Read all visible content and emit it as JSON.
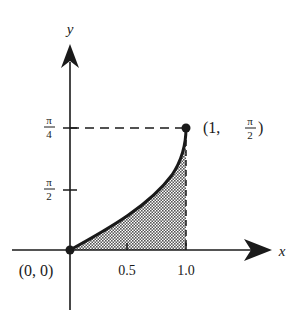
{
  "diagram": {
    "axes": {
      "x_label": "x",
      "y_label": "y"
    },
    "x_ticks": [
      "0.5",
      "1.0"
    ],
    "y_ticks": [
      {
        "num": "π",
        "den": "4"
      },
      {
        "num": "π",
        "den": "2"
      }
    ],
    "points": [
      {
        "label": "(0, 0)"
      },
      {
        "label_prefix": "(1, ",
        "label_num": "π",
        "label_den": "2",
        "label_suffix": ")"
      }
    ],
    "region": "shaded area under curve from x = 0 to x = 1",
    "colors": {
      "ink": "#1a1a1a",
      "shade": "#9a9a9a",
      "background": "#ffffff"
    }
  }
}
